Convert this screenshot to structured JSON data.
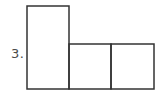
{
  "problem": {
    "number_label": "3."
  },
  "figure": {
    "stroke_color": "#333333",
    "stroke_width": 1.5,
    "shapes": [
      {
        "name": "tall-rectangle",
        "x": 27,
        "y": 6,
        "width": 42,
        "height": 83
      },
      {
        "name": "square-middle",
        "x": 69,
        "y": 44,
        "width": 42,
        "height": 45
      },
      {
        "name": "square-right",
        "x": 111,
        "y": 44,
        "width": 43,
        "height": 45
      }
    ]
  }
}
